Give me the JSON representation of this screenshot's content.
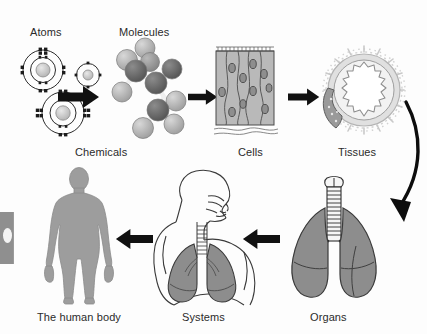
{
  "diagram": {
    "background_color": "#fdfdfd",
    "ink_color": "#2b2b2b",
    "fill_gray": "#9a9a9a",
    "fill_gray_light": "#c4c4c4",
    "fill_gray_dark": "#6d6d6d"
  },
  "labels": {
    "atoms": "Atoms",
    "molecules": "Molecules",
    "cells": "Cells",
    "tissues": "Tissues",
    "chemicals": "Chemicals",
    "human_body": "The human body",
    "systems": "Systems",
    "organs": "Organs"
  },
  "stages": [
    {
      "id": "atoms",
      "label": "Atoms",
      "row": "top",
      "order": 1,
      "icon": "bohr-atom-icon"
    },
    {
      "id": "molecules",
      "label": "Molecules",
      "row": "top",
      "order": 2,
      "icon": "ball-and-stick-molecule-icon"
    },
    {
      "id": "cells",
      "label": "Cells",
      "row": "top",
      "order": 3,
      "icon": "columnar-epithelium-icon"
    },
    {
      "id": "tissues",
      "label": "Tissues",
      "row": "top",
      "order": 4,
      "icon": "tissue-cross-section-icon"
    },
    {
      "id": "organs",
      "label": "Organs",
      "row": "bottom",
      "order": 5,
      "icon": "lungs-icon"
    },
    {
      "id": "systems",
      "label": "Systems",
      "row": "bottom",
      "order": 6,
      "icon": "respiratory-system-torso-icon"
    },
    {
      "id": "human_body",
      "label": "The human body",
      "row": "bottom",
      "order": 7,
      "icon": "human-silhouette-icon"
    }
  ],
  "grouping": {
    "chemicals_label": "Chemicals",
    "chemicals_covers": [
      "atoms",
      "molecules"
    ]
  },
  "arrows": [
    {
      "id": "atoms-to-molecules",
      "from": "atoms",
      "to": "molecules",
      "direction": "right",
      "style": "straight"
    },
    {
      "id": "molecules-to-cells",
      "from": "molecules",
      "to": "cells",
      "direction": "right",
      "style": "straight"
    },
    {
      "id": "cells-to-tissues",
      "from": "cells",
      "to": "tissues",
      "direction": "right",
      "style": "straight"
    },
    {
      "id": "tissues-to-organs",
      "from": "tissues",
      "to": "organs",
      "direction": "down-left",
      "style": "curved"
    },
    {
      "id": "organs-to-systems",
      "from": "organs",
      "to": "systems",
      "direction": "left",
      "style": "straight"
    },
    {
      "id": "systems-to-human-body",
      "from": "systems",
      "to": "human_body",
      "direction": "left",
      "style": "straight"
    }
  ]
}
